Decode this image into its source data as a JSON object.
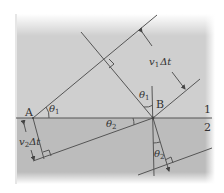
{
  "diagram": {
    "colors": {
      "background": "#ffffff",
      "medium1": "#cfcfcf",
      "medium2": "#bdbdbd",
      "lines": "#555555",
      "text": "#333333"
    },
    "labels": {
      "point_a": "A",
      "point_b": "B",
      "medium_1": "1",
      "medium_2": "2",
      "theta1_at_a": "θ",
      "theta1_at_a_sub": "1",
      "theta1_at_b": "θ",
      "theta1_at_b_sub": "1",
      "theta2_at_boundary": "θ",
      "theta2_at_boundary_sub": "2",
      "theta2_at_bottom": "θ",
      "theta2_at_bottom_sub": "2",
      "v1_dt": "v",
      "v1_dt_sub": "1",
      "v1_dt_tail": "Δt",
      "v2_dt": "v",
      "v2_dt_sub": "2",
      "v2_dt_tail": "Δt"
    }
  }
}
